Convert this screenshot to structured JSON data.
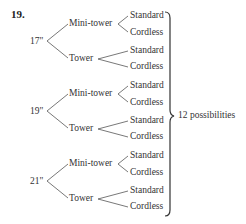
{
  "problem_number": "19.",
  "tree": {
    "levels": [
      "Monitor size",
      "Case",
      "Keyboard"
    ],
    "branches": [
      {
        "label": "17\"",
        "children": [
          {
            "label": "Mini-tower",
            "children": [
              "Standard",
              "Cordless"
            ]
          },
          {
            "label": "Tower",
            "children": [
              "Standard",
              "Cordless"
            ]
          }
        ]
      },
      {
        "label": "19\"",
        "children": [
          {
            "label": "Mini-tower",
            "children": [
              "Standard",
              "Cordless"
            ]
          },
          {
            "label": "Tower",
            "children": [
              "Standard",
              "Cordless"
            ]
          }
        ]
      },
      {
        "label": "21\"",
        "children": [
          {
            "label": "Mini-tower",
            "children": [
              "Standard",
              "Cordless"
            ]
          },
          {
            "label": "Tower",
            "children": [
              "Standard",
              "Cordless"
            ]
          }
        ]
      }
    ]
  },
  "summary": "12 possibilities",
  "colors": {
    "line": "#555555",
    "text": "#333333"
  }
}
